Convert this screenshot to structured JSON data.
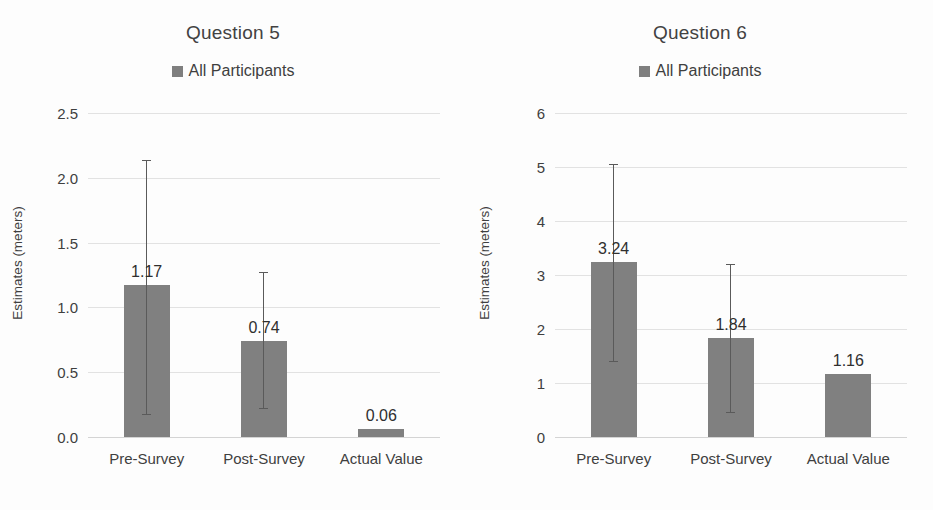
{
  "chart_data": [
    {
      "type": "bar",
      "title": "Question 5",
      "xlabel": "",
      "ylabel": "Estimates (meters)",
      "legend": [
        {
          "name": "All Participants",
          "color": "#7f7f7f"
        }
      ],
      "legend_position": "top",
      "grid": true,
      "ylim": [
        0.0,
        2.5
      ],
      "yticks": [
        "0.0",
        "0.5",
        "1.0",
        "1.5",
        "2.0",
        "2.5"
      ],
      "ytick_values": [
        0.0,
        0.5,
        1.0,
        1.5,
        2.0,
        2.5
      ],
      "categories": [
        "Pre-Survey",
        "Post-Survey",
        "Actual Value"
      ],
      "values": [
        1.17,
        0.74,
        0.06
      ],
      "value_labels": [
        "1.17",
        "0.74",
        "0.06"
      ],
      "error_low": [
        0.18,
        0.22,
        null
      ],
      "error_high": [
        2.14,
        1.27,
        null
      ]
    },
    {
      "type": "bar",
      "title": "Question 6",
      "xlabel": "",
      "ylabel": "Estimates (meters)",
      "legend": [
        {
          "name": "All Participants",
          "color": "#7f7f7f"
        }
      ],
      "legend_position": "top",
      "grid": true,
      "ylim": [
        0,
        6
      ],
      "yticks": [
        "0",
        "1",
        "2",
        "3",
        "4",
        "5",
        "6"
      ],
      "ytick_values": [
        0,
        1,
        2,
        3,
        4,
        5,
        6
      ],
      "categories": [
        "Pre-Survey",
        "Post-Survey",
        "Actual Value"
      ],
      "values": [
        3.24,
        1.84,
        1.16
      ],
      "value_labels": [
        "3.24",
        "1.84",
        "1.16"
      ],
      "error_low": [
        1.4,
        0.47,
        null
      ],
      "error_high": [
        5.05,
        3.2,
        null
      ]
    }
  ],
  "colors": {
    "bar": "#808080",
    "grid": "#e2e2e2",
    "text": "#3f3f3f",
    "error": "#5a5a5a"
  }
}
